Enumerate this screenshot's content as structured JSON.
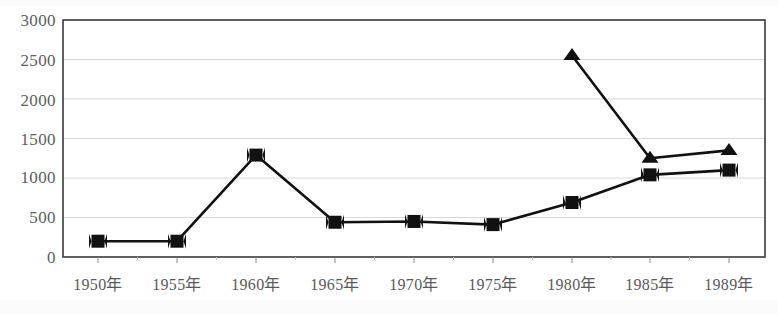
{
  "chart_data": {
    "type": "line",
    "title": "",
    "subtitle": "",
    "xlabel": "",
    "ylabel": "",
    "categories": [
      "1950年",
      "1955年",
      "1960年",
      "1965年",
      "1970年",
      "1975年",
      "1980年",
      "1985年",
      "1989年"
    ],
    "ytick_labels": [
      "3000",
      "2500",
      "2000",
      "1500",
      "1000",
      "500",
      "0"
    ],
    "ytick_values": [
      3000,
      2500,
      2000,
      1500,
      1000,
      500,
      0
    ],
    "ylim": [
      0,
      3000
    ],
    "grid": "horizontal",
    "legend": "none",
    "series": [
      {
        "name": "series-square",
        "marker": "square",
        "color": "#111111",
        "values": [
          200,
          200,
          1290,
          440,
          450,
          410,
          690,
          1040,
          1100
        ]
      },
      {
        "name": "series-triangle",
        "marker": "triangle",
        "color": "#111111",
        "values": [
          null,
          null,
          null,
          null,
          null,
          null,
          2550,
          1250,
          1350
        ]
      }
    ]
  },
  "style": {
    "plot_border_color": "#3a3a3a",
    "gridline_color": "#d8d8d8",
    "line_color": "#111111",
    "marker_color": "#111111",
    "tick_color": "#8a8a8a",
    "label_color": "#5a5a5a",
    "background": "#ffffff"
  }
}
